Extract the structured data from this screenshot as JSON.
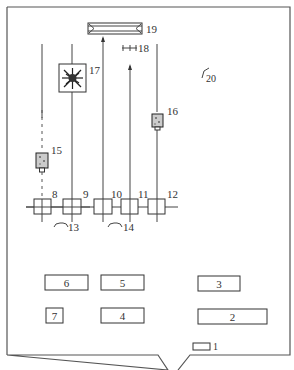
{
  "diagram": {
    "type": "equipment-layout-schematic",
    "colors": {
      "line": "#444444",
      "frame": "#555555",
      "background": "#ffffff"
    },
    "frame": {
      "left": 7,
      "top": 7,
      "right": 290,
      "bottom": 355,
      "notch": {
        "x1": 160,
        "x2": 190,
        "depth": 14
      }
    },
    "labels": {
      "l1": "1",
      "l2": "2",
      "l3": "3",
      "l4": "4",
      "l5": "5",
      "l6": "6",
      "l7": "7",
      "l8": "8",
      "l9": "9",
      "l10": "10",
      "l11": "11",
      "l12": "12",
      "l13": "13",
      "l14": "14",
      "l15": "15",
      "l16": "16",
      "l17": "17",
      "l18": "18",
      "l19": "19",
      "l20": "20"
    },
    "components": [
      {
        "id": "1",
        "kind": "small-box",
        "desc": "small rectangle near bottom edge"
      },
      {
        "id": "2",
        "kind": "desk-box"
      },
      {
        "id": "3",
        "kind": "desk-box"
      },
      {
        "id": "4",
        "kind": "desk-box"
      },
      {
        "id": "5",
        "kind": "desk-box"
      },
      {
        "id": "6",
        "kind": "desk-box"
      },
      {
        "id": "7",
        "kind": "small-box"
      },
      {
        "id": "8",
        "kind": "crossed-square"
      },
      {
        "id": "9",
        "kind": "crossed-square"
      },
      {
        "id": "10",
        "kind": "crossed-square"
      },
      {
        "id": "11",
        "kind": "crossed-square"
      },
      {
        "id": "12",
        "kind": "crossed-square"
      },
      {
        "id": "13",
        "kind": "arc-symbol"
      },
      {
        "id": "14",
        "kind": "arc-symbol"
      },
      {
        "id": "15",
        "kind": "textured-block"
      },
      {
        "id": "16",
        "kind": "textured-block"
      },
      {
        "id": "17",
        "kind": "burst-target"
      },
      {
        "id": "18",
        "kind": "tick-marker"
      },
      {
        "id": "19",
        "kind": "long-prism"
      },
      {
        "id": "20",
        "kind": "corner-mark"
      }
    ]
  }
}
